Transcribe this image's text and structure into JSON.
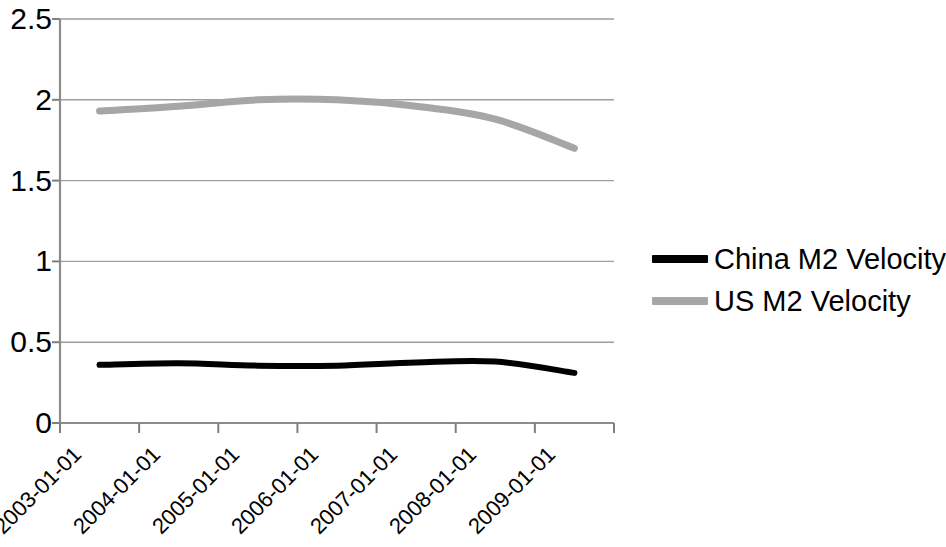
{
  "chart_data": {
    "type": "line",
    "title": "",
    "subtitle": "",
    "xlabel": "",
    "ylabel": "",
    "x": [
      "2003-01-01",
      "2004-01-01",
      "2005-01-01",
      "2006-01-01",
      "2007-01-01",
      "2008-01-01",
      "2009-01-01"
    ],
    "categories": [
      "2003-01-01",
      "2004-01-01",
      "2005-01-01",
      "2006-01-01",
      "2007-01-01",
      "2008-01-01",
      "2009-01-01"
    ],
    "series": [
      {
        "name": "China M2 Velocity",
        "color": "#000000",
        "values": [
          0.36,
          0.37,
          0.355,
          0.355,
          0.375,
          0.38,
          0.31
        ]
      },
      {
        "name": "US M2 Velocity",
        "color": "#a6a6a6",
        "values": [
          1.93,
          1.96,
          2.0,
          2.0,
          1.96,
          1.88,
          1.7
        ]
      }
    ],
    "ylim": [
      0,
      2.5
    ],
    "ytick_values": [
      0,
      0.5,
      1,
      1.5,
      2,
      2.5
    ],
    "ytick_labels": [
      "0",
      "0.5",
      "1",
      "1.5",
      "2",
      "2.5"
    ],
    "grid": true,
    "grid_axis": "y",
    "legend_position": "right",
    "legend": [
      {
        "label": "China M2 Velocity",
        "color": "#000000"
      },
      {
        "label": "US M2 Velocity",
        "color": "#a6a6a6"
      }
    ]
  },
  "colors": {
    "background": "#ffffff",
    "axis": "#7f7f7f",
    "gridline": "#9e9e9e",
    "china_series": "#000000",
    "us_series": "#a6a6a6",
    "text": "#000000"
  },
  "axis_labels": {
    "y": [
      "2.5",
      "2",
      "1.5",
      "1",
      "0.5",
      "0"
    ],
    "x": [
      "2003-01-01",
      "2004-01-01",
      "2005-01-01",
      "2006-01-01",
      "2007-01-01",
      "2008-01-01",
      "2009-01-01"
    ]
  },
  "legend_items": {
    "china": "China M2 Velocity",
    "us": "US M2 Velocity"
  }
}
